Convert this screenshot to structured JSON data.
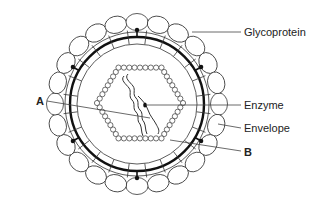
{
  "diagram": {
    "labels": {
      "glycoprotein": "Glycoprotein",
      "enzyme": "Enzyme",
      "envelope": "Envelope",
      "a": "A",
      "b": "B"
    },
    "geometry": {
      "center": [
        137,
        104
      ],
      "outer_ring_radius": 82,
      "membrane_outer_radius": 70,
      "membrane_inner_radius": 60,
      "ellipse_count": 24,
      "capsid_center": [
        140,
        103
      ],
      "capsid_radius": 43,
      "capsid_bead_count": 48
    },
    "colors": {
      "stroke": "#333333",
      "background": "#ffffff"
    }
  }
}
